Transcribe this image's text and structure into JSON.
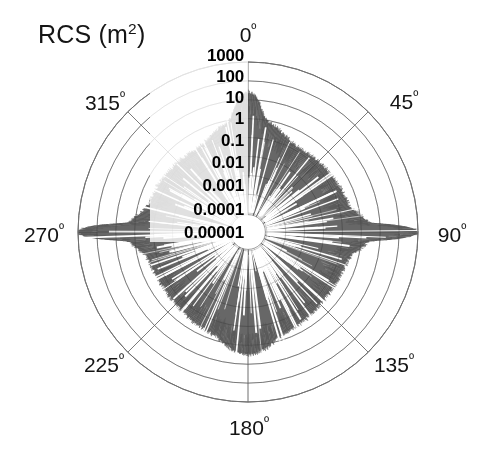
{
  "figure": {
    "width": 491,
    "height": 464,
    "background": "#ffffff",
    "axis_title": "RCS (m",
    "axis_title_exponent": "2",
    "axis_title_close": ")"
  },
  "chart_data": {
    "type": "line",
    "subtype": "polar-radar-cross-section",
    "title": "RCS (m2)",
    "xlabel": "Aspect angle (degrees)",
    "ylabel": "RCS (m^2)",
    "grid": true,
    "legend": null,
    "angular_unit": "degrees",
    "angular_direction": "clockwise",
    "angular_zero_at": "top",
    "angular_tick_labels": [
      "0º",
      "45º",
      "90º",
      "135º",
      "180º",
      "225º",
      "270º",
      "315º"
    ],
    "angular_tick_values": [
      0,
      45,
      90,
      135,
      180,
      225,
      270,
      315
    ],
    "radial_scale": "log10",
    "radial_tick_labels": [
      "1000",
      "100",
      "10",
      "1",
      "0.1",
      "0.01",
      "0.001",
      "0.0001",
      "0.00001"
    ],
    "radial_tick_values": [
      1000,
      100,
      10,
      1,
      0.1,
      0.01,
      0.001,
      0.0001,
      1e-05
    ],
    "rlim": [
      1e-05,
      1000
    ],
    "series": [
      {
        "name": "RCS vs aspect angle",
        "color": "#5a5a5a",
        "fill": true,
        "lobes": [
          {
            "center": 0,
            "peak": 20.0,
            "width": 3.0,
            "floor": 0.003
          },
          {
            "center": 0,
            "peak": 0.9,
            "width": 11.0,
            "floor": 0.003
          },
          {
            "center": 45,
            "peak": 0.12,
            "width": 26.0,
            "floor": 0.003
          },
          {
            "center": 90,
            "peak": 900.0,
            "width": 1.1,
            "floor": 0.003
          },
          {
            "center": 90,
            "peak": 2.5,
            "width": 5.0,
            "floor": 0.003
          },
          {
            "center": 90,
            "peak": 0.22,
            "width": 22.0,
            "floor": 0.003
          },
          {
            "center": 135,
            "peak": 0.1,
            "width": 26.0,
            "floor": 0.003
          },
          {
            "center": 180,
            "peak": 2.0,
            "width": 7.0,
            "floor": 0.003
          },
          {
            "center": 180,
            "peak": 0.45,
            "width": 24.0,
            "floor": 0.003
          },
          {
            "center": 225,
            "peak": 0.1,
            "width": 26.0,
            "floor": 0.003
          },
          {
            "center": 270,
            "peak": 900.0,
            "width": 1.1,
            "floor": 0.003
          },
          {
            "center": 270,
            "peak": 2.0,
            "width": 5.0,
            "floor": 0.003
          },
          {
            "center": 270,
            "peak": 0.2,
            "width": 22.0,
            "floor": 0.003
          },
          {
            "center": 315,
            "peak": 0.11,
            "width": 26.0,
            "floor": 0.003
          }
        ],
        "baseline": 0.0025,
        "scintillation_db": 16.0,
        "sample_count": 3600
      }
    ]
  },
  "geometry": {
    "center_x": 248,
    "center_y": 232,
    "outer_radius": 170,
    "ring_count": 9,
    "spoke_count": 8,
    "grid_color": "#888888",
    "grid_width": 0.9,
    "data_color": "#5a5a5a",
    "data_color_light": "#8d8d8d"
  },
  "labels": {
    "angular": [
      {
        "text": "0",
        "degree": "º",
        "angle": 0,
        "x": 248,
        "y": 35
      },
      {
        "text": "45",
        "degree": "º",
        "angle": 45,
        "x": 404,
        "y": 102
      },
      {
        "text": "90",
        "degree": "º",
        "angle": 90,
        "x": 452,
        "y": 235
      },
      {
        "text": "135",
        "degree": "º",
        "angle": 135,
        "x": 394,
        "y": 365
      },
      {
        "text": "180",
        "degree": "º",
        "angle": 180,
        "x": 249,
        "y": 428
      },
      {
        "text": "225",
        "degree": "º",
        "angle": 225,
        "x": 104,
        "y": 365
      },
      {
        "text": "270",
        "degree": "º",
        "angle": 270,
        "x": 44,
        "y": 235
      },
      {
        "text": "315",
        "degree": "º",
        "angle": 315,
        "x": 105,
        "y": 103
      }
    ],
    "radial": [
      {
        "text": "1000",
        "x": 244,
        "y": 56
      },
      {
        "text": "100",
        "x": 244,
        "y": 77
      },
      {
        "text": "10",
        "x": 244,
        "y": 98
      },
      {
        "text": "1",
        "x": 244,
        "y": 119
      },
      {
        "text": "0.1",
        "x": 244,
        "y": 141
      },
      {
        "text": "0.01",
        "x": 244,
        "y": 163
      },
      {
        "text": "0.001",
        "x": 244,
        "y": 186
      },
      {
        "text": "0.0001",
        "x": 244,
        "y": 210
      },
      {
        "text": "0.00001",
        "x": 244,
        "y": 233
      }
    ]
  }
}
